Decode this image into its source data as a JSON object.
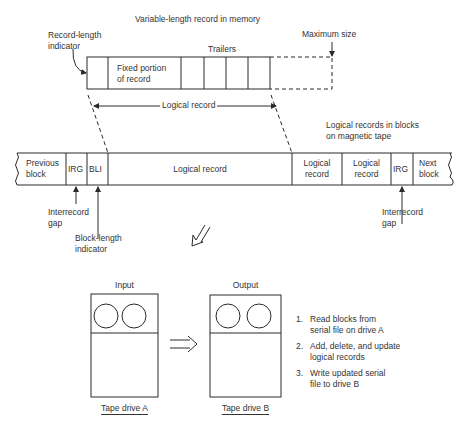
{
  "title": "Variable-length record in memory",
  "memory_record": {
    "record_length_indicator": [
      "Record-length",
      "indicator"
    ],
    "fixed_portion": [
      "Fixed portion",
      "of record"
    ],
    "trailers_label": "Trailers",
    "maximum_size_label": "Maximum size",
    "logical_record_span_label": "Logical record"
  },
  "tape": {
    "caption": [
      "Logical records in blocks",
      "on magnetic tape"
    ],
    "cells": [
      {
        "lines": [
          "Previous",
          "block"
        ]
      },
      {
        "lines": [
          "IRG"
        ]
      },
      {
        "lines": [
          "BLI"
        ]
      },
      {
        "lines": [
          "Logical record"
        ]
      },
      {
        "lines": [
          "Logical",
          "record"
        ]
      },
      {
        "lines": [
          "Logical",
          "record"
        ]
      },
      {
        "lines": [
          "IRG"
        ]
      },
      {
        "lines": [
          "Next",
          "block"
        ]
      }
    ],
    "callouts": {
      "left_irg": [
        "Interrecord",
        "gap"
      ],
      "bli": [
        "Block-length",
        "indicator"
      ],
      "right_irg": [
        "Interrecord",
        "gap"
      ]
    }
  },
  "drives": {
    "input": {
      "heading": "Input",
      "label": "Tape drive A"
    },
    "output": {
      "heading": "Output",
      "label": "Tape drive B"
    }
  },
  "steps": [
    {
      "num": "1.",
      "lines": [
        "Read blocks from",
        "serial file on drive A"
      ]
    },
    {
      "num": "2.",
      "lines": [
        "Add, delete, and update",
        "logical records"
      ]
    },
    {
      "num": "3.",
      "lines": [
        "Write updated serial",
        "file to drive B"
      ]
    }
  ],
  "colors": {
    "line": "#2a2a2a",
    "background": "#ffffff"
  }
}
